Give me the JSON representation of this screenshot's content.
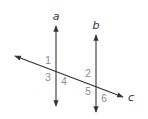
{
  "diagram": {
    "lines": [
      {
        "id": "a",
        "label": "a",
        "x1": 56,
        "y1": 26,
        "x2": 56,
        "y2": 106,
        "color": "#555555"
      },
      {
        "id": "b",
        "label": "b",
        "x1": 96,
        "y1": 35,
        "x2": 96,
        "y2": 112,
        "color": "#555555"
      },
      {
        "id": "c",
        "label": "c",
        "x1": 15,
        "y1": 56,
        "x2": 123,
        "y2": 97,
        "color": "#333333"
      }
    ],
    "line_labels": {
      "a": {
        "text": "a",
        "x": 56,
        "y": 20
      },
      "b": {
        "text": "b",
        "x": 96,
        "y": 29
      },
      "c": {
        "text": "c",
        "x": 131,
        "y": 101
      }
    },
    "angles": [
      {
        "text": "1",
        "x": 48,
        "y": 64
      },
      {
        "text": "2",
        "x": 88,
        "y": 77
      },
      {
        "text": "3",
        "x": 48,
        "y": 81
      },
      {
        "text": "4",
        "x": 64,
        "y": 85
      },
      {
        "text": "5",
        "x": 88,
        "y": 95
      },
      {
        "text": "6",
        "x": 104,
        "y": 102
      }
    ],
    "colors": {
      "background": "#ffffff",
      "line": "#555555",
      "transversal": "#333333",
      "angle_text": "#8a8a8a"
    }
  }
}
